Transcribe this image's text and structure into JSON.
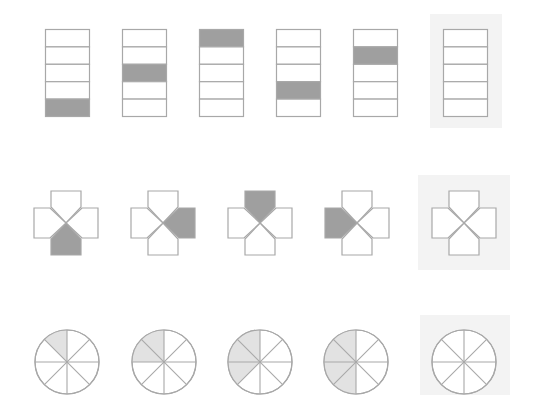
{
  "colors": {
    "stroke": "#a8a8a8",
    "dark_fill": "#9f9f9f",
    "light_fill": "#e2e2e2",
    "panel": "#f3f3f3",
    "empty": "#ffffff"
  },
  "rows": [
    {
      "name": "stacked-boxes",
      "type": "stack",
      "cells": 5,
      "items": [
        {
          "x": 45,
          "shaded_index": 4
        },
        {
          "x": 122,
          "shaded_index": 2
        },
        {
          "x": 199,
          "shaded_index": 0
        },
        {
          "x": 276,
          "shaded_index": 3
        },
        {
          "x": 353,
          "shaded_index": 1
        },
        {
          "x": 443,
          "shaded_index": null,
          "answer_slot": true
        }
      ],
      "y": 29,
      "width": 44,
      "height": 87,
      "panel": {
        "x": 430,
        "y": 14,
        "w": 72,
        "h": 114
      }
    },
    {
      "name": "cross-pentagons",
      "type": "cross",
      "items": [
        {
          "cx": 66,
          "shaded": "bottom"
        },
        {
          "cx": 163,
          "shaded": "right"
        },
        {
          "cx": 260,
          "shaded": "top"
        },
        {
          "cx": 357,
          "shaded": "left"
        },
        {
          "cx": 464,
          "shaded": null,
          "answer_slot": true
        }
      ],
      "cy": 223,
      "panel": {
        "x": 418,
        "y": 175,
        "w": 92,
        "h": 95
      }
    },
    {
      "name": "octant-circles",
      "type": "circle",
      "items": [
        {
          "cx": 67,
          "shaded_octants": 1
        },
        {
          "cx": 164,
          "shaded_octants": 2
        },
        {
          "cx": 260,
          "shaded_octants": 3
        },
        {
          "cx": 356,
          "shaded_octants": 4
        },
        {
          "cx": 464,
          "shaded_octants": 0,
          "answer_slot": true
        }
      ],
      "cy": 362,
      "r": 32,
      "panel": {
        "x": 420,
        "y": 315,
        "w": 90,
        "h": 80
      }
    }
  ]
}
